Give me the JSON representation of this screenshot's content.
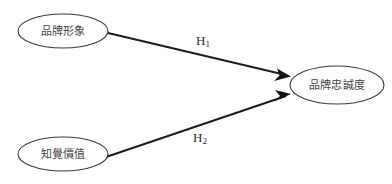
{
  "diagram": {
    "title": "",
    "background_color": "#ffffff",
    "node_stroke_color": "#3a3a3a",
    "node_fill_color": "#ffffff",
    "path_color": "#1c1c1c",
    "label_color": "#454545",
    "nodes": [
      {
        "id": "brand-image",
        "label": "品牌形象",
        "cx": 63,
        "cy": 31,
        "rx": 45,
        "ry": 17
      },
      {
        "id": "perceived-value",
        "label": "知覺價值",
        "cx": 63,
        "cy": 154,
        "rx": 45,
        "ry": 17
      },
      {
        "id": "brand-loyalty",
        "label": "品牌忠誠度",
        "cx": 337,
        "cy": 85,
        "rx": 47,
        "ry": 19
      }
    ],
    "paths": [
      {
        "id": "h1",
        "label_base": "H",
        "label_subscript": "1",
        "from": "brand-image",
        "to": "brand-loyalty",
        "x1": 108,
        "y1": 33,
        "x2": 290,
        "y2": 76,
        "label_x": 203,
        "label_y": 45
      },
      {
        "id": "h2",
        "label_base": "H",
        "label_subscript": "2",
        "from": "perceived-value",
        "to": "brand-loyalty",
        "x1": 106,
        "y1": 157,
        "x2": 290,
        "y2": 95,
        "label_x": 200,
        "label_y": 142
      }
    ]
  }
}
